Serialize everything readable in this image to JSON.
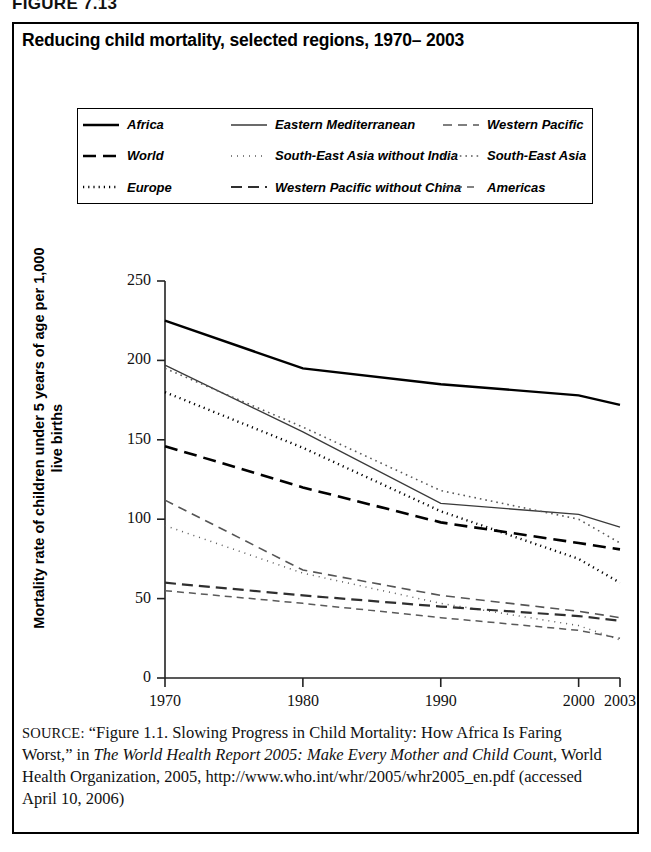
{
  "figure": {
    "number": "FIGURE 7.13",
    "title": "Reducing child mortality, selected regions, 1970– 2003"
  },
  "legend": {
    "items": [
      {
        "label": "Africa",
        "style": "solid-heavy",
        "color": "#000000"
      },
      {
        "label": "Eastern Mediterranean",
        "style": "solid-thin",
        "color": "#333333"
      },
      {
        "label": "Western Pacific",
        "style": "dashed-thin",
        "color": "#555555"
      },
      {
        "label": "World",
        "style": "dashed-heavy",
        "color": "#000000"
      },
      {
        "label": "South-East Asia without India",
        "style": "dotted-fine",
        "color": "#555555"
      },
      {
        "label": "South-East Asia",
        "style": "dotted-fine2",
        "color": "#555555"
      },
      {
        "label": "Europe",
        "style": "dotted-heavy",
        "color": "#000000"
      },
      {
        "label": "Western Pacific without China",
        "style": "dashed-med",
        "color": "#333333"
      },
      {
        "label": "Americas",
        "style": "dashdot",
        "color": "#555555"
      }
    ]
  },
  "axes": {
    "y_title": "Mortality rate of children under 5 years of age per 1,000 live births",
    "y_ticks": [
      "250",
      "200",
      "150",
      "100",
      "50",
      "0"
    ],
    "x_ticks": [
      "1970",
      "1980",
      "1990",
      "2000",
      "2003"
    ]
  },
  "source": {
    "label": "SOURCE:",
    "line1_a": "“Figure 1.1. Slowing Progress in Child Mortality: How Africa Is Faring Worst,” in ",
    "line1_italic": "The World Health Report 2005: Make Every Mother and Child Coun",
    "line1_b": "t, World Health Organization, 2005, http://www.who.int/whr/2005/whr2005_en.pdf (accessed April 10, 2006)"
  },
  "chart_data": {
    "type": "line",
    "title": "Reducing child mortality, selected regions, 1970– 2003",
    "xlabel": "",
    "ylabel": "Mortality rate of children under 5 years of age per 1,000 live births",
    "x": [
      1970,
      1980,
      1990,
      2000,
      2003
    ],
    "xlim": [
      1970,
      2003
    ],
    "ylim": [
      0,
      250
    ],
    "ytick_values": [
      0,
      50,
      100,
      150,
      200,
      250
    ],
    "xtick_values": [
      1970,
      1980,
      1990,
      2000,
      2003
    ],
    "grid": false,
    "legend_position": "above-plot",
    "units": "deaths per 1,000 live births",
    "series": [
      {
        "name": "Africa",
        "style": "solid-heavy",
        "color": "#000000",
        "values": [
          225,
          195,
          185,
          178,
          172
        ]
      },
      {
        "name": "Eastern Mediterranean",
        "style": "solid-thin",
        "color": "#333333",
        "values": [
          197,
          155,
          110,
          103,
          95
        ]
      },
      {
        "name": "South-East Asia",
        "style": "dotted-fine2",
        "color": "#555555",
        "values": [
          195,
          158,
          118,
          100,
          85
        ]
      },
      {
        "name": "Europe",
        "style": "dotted-heavy",
        "color": "#000000",
        "values": [
          180,
          145,
          105,
          75,
          60
        ]
      },
      {
        "name": "World",
        "style": "dashed-heavy",
        "color": "#000000",
        "values": [
          146,
          120,
          98,
          85,
          81
        ]
      },
      {
        "name": "Western Pacific",
        "style": "dashed-thin",
        "color": "#555555",
        "values": [
          112,
          68,
          52,
          42,
          38
        ]
      },
      {
        "name": "South-East Asia without India",
        "style": "dotted-fine",
        "color": "#555555",
        "values": [
          96,
          66,
          47,
          33,
          24
        ]
      },
      {
        "name": "Western Pacific without China",
        "style": "dashed-med",
        "color": "#333333",
        "values": [
          60,
          52,
          45,
          39,
          36
        ]
      },
      {
        "name": "Americas",
        "style": "dashdot",
        "color": "#555555",
        "values": [
          55,
          47,
          38,
          30,
          25
        ]
      }
    ]
  }
}
